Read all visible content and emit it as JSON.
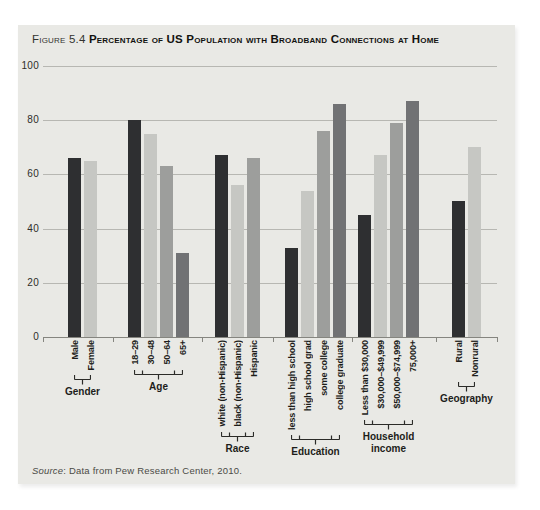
{
  "figure": {
    "label": "Figure 5.4",
    "title": "Percentage of US Population with Broadband Connections at Home",
    "source_label": "Source",
    "source_text": ": Data from Pew Research Center, 2010."
  },
  "chart_data": {
    "type": "bar",
    "title": "Figure 5.4 Percentage of US Population with Broadband Connections at Home",
    "xlabel": "",
    "ylabel": "",
    "ylim": [
      0,
      100
    ],
    "yticks": [
      0,
      20,
      40,
      60,
      80,
      100
    ],
    "grid": true,
    "legend": false,
    "bar_color_cycle": [
      "#2e2f31",
      "#c6c7c3",
      "#9d9e9c",
      "#717274"
    ],
    "groups": [
      {
        "name": "Gender",
        "bars": [
          {
            "label": "Male",
            "value": 66
          },
          {
            "label": "Female",
            "value": 65
          }
        ]
      },
      {
        "name": "Age",
        "bars": [
          {
            "label": "18–29",
            "value": 80
          },
          {
            "label": "30–48",
            "value": 75
          },
          {
            "label": "50–64",
            "value": 63
          },
          {
            "label": "65+",
            "value": 31
          }
        ]
      },
      {
        "name": "Race",
        "bars": [
          {
            "label": "white (non-Hispanic)",
            "value": 67
          },
          {
            "label": "black (non-Hispanic)",
            "value": 56
          },
          {
            "label": "Hispanic",
            "value": 66
          }
        ]
      },
      {
        "name": "Education",
        "bars": [
          {
            "label": "less than high school",
            "value": 33
          },
          {
            "label": "high school grad",
            "value": 54
          },
          {
            "label": "some college",
            "value": 76
          },
          {
            "label": "college graduate",
            "value": 86
          }
        ]
      },
      {
        "name": "Household income",
        "bars": [
          {
            "label": "Less than $30,000",
            "value": 45
          },
          {
            "label": "$30,000–$49,999",
            "value": 67
          },
          {
            "label": "$50,000–$74,999",
            "value": 79
          },
          {
            "label": "75,000+",
            "value": 87
          }
        ]
      },
      {
        "name": "Geography",
        "bars": [
          {
            "label": "Rural",
            "value": 50
          },
          {
            "label": "Nonrural",
            "value": 70
          }
        ]
      }
    ]
  },
  "colors": {
    "panel_bg": "#e9e9e5",
    "grid": "#b7b7b2",
    "axis": "#85857f",
    "text": "#1d1d1a",
    "bar_dark": "#2e2f31",
    "bar_light": "#c6c7c3",
    "bar_medium": "#9d9e9c",
    "bar_gray_dark": "#717274"
  }
}
